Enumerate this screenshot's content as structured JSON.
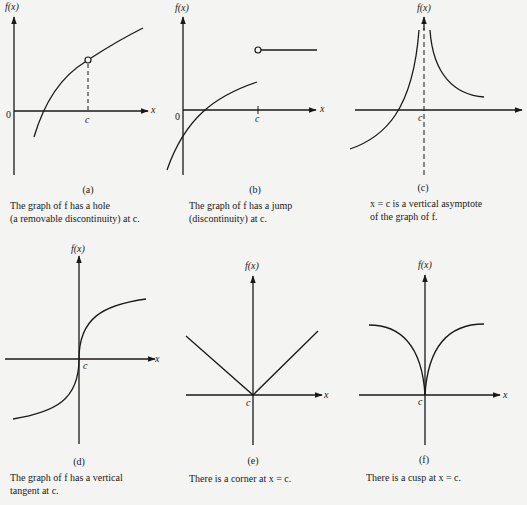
{
  "figure": {
    "panels": [
      {
        "id": "a",
        "tag": "(a)",
        "y_label": "f(x)",
        "x_label": "x",
        "origin_label": "0",
        "point_label": "c",
        "caption_line1": "The graph of f has a hole",
        "caption_line2": "(a removable discontinuity) at c.",
        "feature": "hole"
      },
      {
        "id": "b",
        "tag": "(b)",
        "y_label": "f(x)",
        "x_label": "x",
        "origin_label": "0",
        "point_label": "c",
        "caption_line1": "The graph of f has a jump",
        "caption_line2": "(discontinuity) at c.",
        "feature": "jump"
      },
      {
        "id": "c",
        "tag": "(c)",
        "y_label": "f(x)",
        "x_label": "",
        "point_label": "c",
        "caption_line1": "x = c is a vertical asymptote",
        "caption_line2": "of the graph of f.",
        "feature": "vertical-asymptote"
      },
      {
        "id": "d",
        "tag": "(d)",
        "y_label": "f(x)",
        "x_label": "x",
        "point_label": "c",
        "caption_line1": "The graph of f has a vertical",
        "caption_line2": "tangent at c.",
        "feature": "vertical-tangent"
      },
      {
        "id": "e",
        "tag": "(e)",
        "y_label": "f(x)",
        "x_label": "x",
        "point_label": "c",
        "caption_line1": "There is a corner at x = c.",
        "caption_line2": "",
        "feature": "corner"
      },
      {
        "id": "f",
        "tag": "(f)",
        "y_label": "f(x)",
        "x_label": "x",
        "point_label": "c",
        "caption_line1": "There is a cusp at x = c.",
        "caption_line2": "",
        "feature": "cusp"
      }
    ],
    "colors": {
      "ink": "#1a1a1a",
      "paper": "#f4f4f2"
    }
  }
}
